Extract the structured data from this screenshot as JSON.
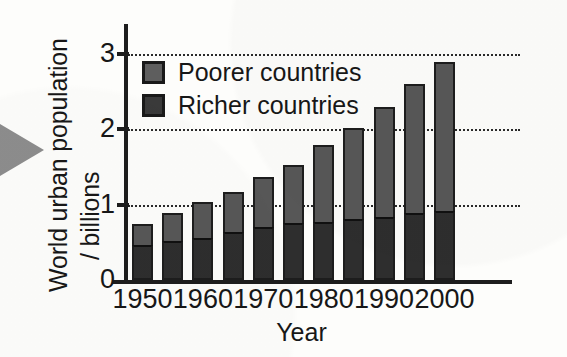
{
  "chart_data": {
    "type": "bar",
    "subtype": "stacked-bar",
    "title": "",
    "xlabel": "Year",
    "ylabel": "World urban population / billions",
    "ylabel_lines": [
      "World urban population",
      "/ billions"
    ],
    "ylim": [
      0,
      3.2
    ],
    "yticks": [
      0,
      1,
      2,
      3
    ],
    "ytick_labels": [
      "0",
      "1",
      "2",
      "3"
    ],
    "grid": true,
    "gridlines_at": [
      1,
      2,
      3
    ],
    "legend_position": "upper-left-inside",
    "x": [
      1950,
      1955,
      1960,
      1965,
      1970,
      1975,
      1980,
      1985,
      1990,
      1995,
      2000
    ],
    "categories": [
      "1950",
      "1955",
      "1960",
      "1965",
      "1970",
      "1975",
      "1980",
      "1985",
      "1990",
      "1995",
      "2000"
    ],
    "xtick_labels": [
      "1950",
      "1960",
      "1970",
      "1980",
      "1990",
      "2000"
    ],
    "xtick_values": [
      1950,
      1960,
      1970,
      1980,
      1990,
      2000
    ],
    "series": [
      {
        "name": "Richer countries",
        "color": "#2e2e2e",
        "values": [
          0.46,
          0.52,
          0.56,
          0.63,
          0.7,
          0.75,
          0.77,
          0.81,
          0.83,
          0.89,
          0.92
        ]
      },
      {
        "name": "Poorer countries",
        "color": "#575757",
        "values": [
          0.28,
          0.37,
          0.47,
          0.54,
          0.66,
          0.78,
          1.02,
          1.21,
          1.46,
          1.7,
          1.97
        ]
      }
    ],
    "totals": [
      0.74,
      0.89,
      1.03,
      1.17,
      1.36,
      1.53,
      1.79,
      2.02,
      2.29,
      2.59,
      2.89
    ]
  },
  "legend": {
    "items": [
      {
        "label": "Poorer countries",
        "swatch_class": "poor"
      },
      {
        "label": "Richer countries",
        "swatch_class": "rich"
      }
    ]
  },
  "annotations": {
    "left_pointer": "triangle-pointer"
  }
}
